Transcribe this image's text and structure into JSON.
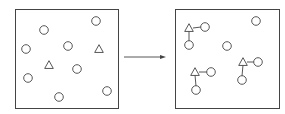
{
  "diagram": {
    "stroke_color": "#444444",
    "background": "#ffffff",
    "panels": [
      {
        "name": "before",
        "box": {
          "x": 15,
          "y": 9,
          "w": 103,
          "h": 99
        },
        "circles": [
          {
            "x": 96,
            "y": 21
          },
          {
            "x": 44,
            "y": 30
          },
          {
            "x": 26,
            "y": 49
          },
          {
            "x": 68,
            "y": 46
          },
          {
            "x": 77,
            "y": 69
          },
          {
            "x": 28,
            "y": 78
          },
          {
            "x": 59,
            "y": 97
          },
          {
            "x": 107,
            "y": 91
          }
        ],
        "triangles": [
          {
            "x": 99,
            "y": 49
          },
          {
            "x": 49,
            "y": 65
          }
        ],
        "bonds": []
      },
      {
        "name": "after",
        "box": {
          "x": 175,
          "y": 9,
          "w": 104,
          "h": 99
        },
        "circles": [
          {
            "x": 256,
            "y": 21
          },
          {
            "x": 205,
            "y": 27
          },
          {
            "x": 189,
            "y": 45
          },
          {
            "x": 227,
            "y": 46
          },
          {
            "x": 258,
            "y": 62
          },
          {
            "x": 242,
            "y": 80
          },
          {
            "x": 211,
            "y": 72
          },
          {
            "x": 196,
            "y": 90
          }
        ],
        "triangles": [
          {
            "x": 189,
            "y": 28
          },
          {
            "x": 243,
            "y": 62
          },
          {
            "x": 195,
            "y": 72
          }
        ],
        "bonds": [
          {
            "x1": 193,
            "y1": 28,
            "x2": 201,
            "y2": 27
          },
          {
            "x1": 189,
            "y1": 31,
            "x2": 189,
            "y2": 41
          },
          {
            "x1": 247,
            "y1": 62,
            "x2": 254,
            "y2": 62
          },
          {
            "x1": 243,
            "y1": 65,
            "x2": 242,
            "y2": 76
          },
          {
            "x1": 199,
            "y1": 72,
            "x2": 207,
            "y2": 72
          },
          {
            "x1": 195,
            "y1": 75,
            "x2": 196,
            "y2": 86
          }
        ]
      }
    ],
    "arrow": {
      "x1": 124,
      "y1": 57,
      "x2": 166,
      "y2": 57
    }
  }
}
